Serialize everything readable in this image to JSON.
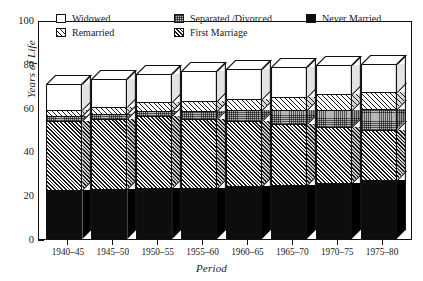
{
  "chart": {
    "type": "bar",
    "title": "",
    "xlabel": "Period",
    "ylabel": "Years of Life"
  },
  "axes": {
    "y": {
      "min": 0,
      "max": 100,
      "major_step": 20,
      "minor_step": 10,
      "ticks": [
        "0",
        "20",
        "40",
        "60",
        "80",
        "100"
      ]
    },
    "x": {
      "categories": [
        "1940–45",
        "1945–50",
        "1950–55",
        "1955–60",
        "1960–65",
        "1965–70",
        "1970–75",
        "1975–80"
      ]
    }
  },
  "legend": {
    "position": "top-inside",
    "entries": [
      {
        "label": "Widowed",
        "pattern": "empty-white-box",
        "swatch_class": "f-widowed",
        "col": 0,
        "row": 0
      },
      {
        "label": "Remarried",
        "pattern": "sparse-diagonal-hatch",
        "swatch_class": "f-remarried",
        "col": 0,
        "row": 1
      },
      {
        "label": "Separated /Divorced",
        "pattern": "gray-stipple",
        "swatch_class": "f-sepdiv",
        "col": 1,
        "row": 0
      },
      {
        "label": "First Marriage",
        "pattern": "dense-diagonal-hatch",
        "swatch_class": "f-first",
        "col": 1,
        "row": 1
      },
      {
        "label": "Never Married",
        "pattern": "solid-black",
        "swatch_class": "f-never",
        "col": 2,
        "row": 0
      }
    ]
  },
  "chart_data": {
    "type": "bar",
    "subtype": "stacked-3d-column",
    "title": "",
    "xlabel": "Period",
    "ylabel": "Years of Life",
    "ylim": [
      0,
      100
    ],
    "grid": false,
    "legend_position": "top-inside",
    "categories": [
      "1940–45",
      "1945–50",
      "1950–55",
      "1955–60",
      "1960–65",
      "1965–70",
      "1970–75",
      "1975–80"
    ],
    "stack_order_bottom_to_top": [
      "Never Married",
      "First Marriage",
      "Separated /Divorced",
      "Remarried",
      "Widowed"
    ],
    "series": [
      {
        "name": "Never Married",
        "fill": "f-never",
        "side": "s-never",
        "values": [
          22.5,
          23.0,
          23.5,
          23.5,
          24.0,
          24.5,
          25.5,
          27.0
        ]
      },
      {
        "name": "First Marriage",
        "fill": "f-first",
        "side": "s-first",
        "values": [
          31.5,
          32.0,
          32.5,
          31.5,
          30.0,
          28.0,
          25.5,
          23.0
        ]
      },
      {
        "name": "Separated /Divorced",
        "fill": "f-sepdiv",
        "side": "s-sepdiv",
        "values": [
          2.0,
          2.0,
          2.5,
          3.5,
          5.0,
          6.5,
          8.0,
          9.5
        ]
      },
      {
        "name": "Remarried",
        "fill": "f-remarried",
        "side": "s-remarried",
        "values": [
          3.0,
          3.5,
          4.0,
          4.5,
          5.0,
          6.0,
          7.0,
          7.5
        ]
      },
      {
        "name": "Widowed",
        "fill": "f-widowed",
        "side": "s-widowed",
        "values": [
          12.0,
          12.5,
          13.0,
          13.5,
          13.5,
          13.5,
          13.5,
          13.0
        ]
      }
    ],
    "totals": [
      71.0,
      73.0,
      75.5,
      76.5,
      77.5,
      78.5,
      79.5,
      80.0
    ]
  }
}
